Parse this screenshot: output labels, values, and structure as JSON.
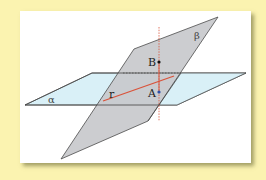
{
  "diagram": {
    "colors": {
      "background": "#fbf3b0",
      "card": "#ffffff",
      "plane_alpha_fill": "#d9f0f7",
      "plane_beta_fill": "#c8c9cc",
      "edge": "#4a4a4a",
      "line_r": "#d9533a",
      "perpendicular": "#d9533a",
      "point_B": "#111111",
      "point_A": "#2a4fa8"
    },
    "planes": [
      {
        "name": "alpha",
        "label": "α"
      },
      {
        "name": "beta",
        "label": "β"
      }
    ],
    "line": {
      "name": "r",
      "label": "r"
    },
    "points": [
      {
        "name": "B",
        "label": "B"
      },
      {
        "name": "A",
        "label": "A"
      }
    ]
  }
}
